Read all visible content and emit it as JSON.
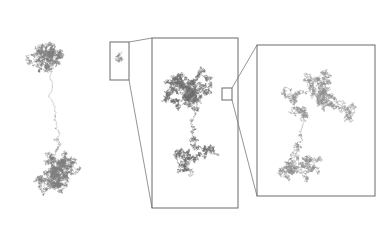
{
  "figure": {
    "background_color": "#ffffff",
    "width": 392,
    "height": 228,
    "walk_color": "#7d7d7d",
    "walk_color_dense": "#6e6e6e",
    "walk_color_sparse": "#8f8f8f",
    "frame_color": "#6b6b6b",
    "connector_color": "#7a7a7a",
    "frame_stroke_width": 1,
    "connector_stroke_width": 0.8
  },
  "panels": [
    {
      "id": "panel-1",
      "name": "full-view-walk",
      "has_frame": false,
      "frame": {
        "x": 14,
        "y": 16,
        "w": 118,
        "h": 200
      },
      "label": "",
      "magnification": "1x",
      "description": "Full random walk trace, two dense clusters joined by a thin filament",
      "zoom_box": {
        "x": 110,
        "y": 42,
        "w": 19,
        "h": 38
      }
    },
    {
      "id": "panel-2",
      "name": "first-magnification",
      "has_frame": true,
      "frame": {
        "x": 152,
        "y": 38,
        "w": 86,
        "h": 170
      },
      "label": "",
      "magnification": "~5x",
      "description": "Magnified content of the panel-1 zoom box; two dense sub-clusters",
      "zoom_box": {
        "x": 222,
        "y": 88,
        "w": 10,
        "h": 12
      }
    },
    {
      "id": "panel-3",
      "name": "second-magnification",
      "has_frame": true,
      "frame": {
        "x": 257,
        "y": 45,
        "w": 118,
        "h": 151
      },
      "label": "",
      "magnification": "~25x",
      "description": "Magnified content of the panel-2 zoom box; resolved individual steps, sparser filaments",
      "zoom_box": null
    }
  ],
  "connectors": [
    {
      "name": "connector-panel1-to-panel2",
      "from_box": "panel-1.zoom_box",
      "to_frame": "panel-2.frame",
      "lines": [
        {
          "x1": 129,
          "y1": 42,
          "x2": 152,
          "y2": 38
        },
        {
          "x1": 129,
          "y1": 80,
          "x2": 152,
          "y2": 208
        }
      ]
    },
    {
      "name": "connector-panel2-to-panel3",
      "from_box": "panel-2.zoom_box",
      "to_frame": "panel-3.frame",
      "lines": [
        {
          "x1": 232,
          "y1": 88,
          "x2": 257,
          "y2": 45
        },
        {
          "x1": 232,
          "y1": 100,
          "x2": 257,
          "y2": 196
        }
      ]
    }
  ],
  "chart_data": {
    "type": "scatter",
    "subtitle": "",
    "xlabel": "",
    "ylabel": "",
    "grid": false,
    "legend": null,
    "annotations": [],
    "series": [
      {
        "name": "walk-panel-1",
        "panel": "panel-1",
        "step_count": 9000,
        "step_length": 1.0,
        "seed": 20240417,
        "color": "#7d7d7d",
        "linewidth": 0.35,
        "bbox": [
          14,
          16,
          132,
          216
        ],
        "clusters": [
          {
            "cx": 60,
            "cy": 58,
            "radius": 46,
            "weight": 0.58
          },
          {
            "cx": 60,
            "cy": 172,
            "radius": 28,
            "weight": 0.26
          }
        ]
      },
      {
        "name": "walk-panel-2",
        "panel": "panel-2",
        "step_count": 7000,
        "step_length": 1.0,
        "seed": 881203,
        "color": "#6e6e6e",
        "linewidth": 0.4,
        "bbox": [
          152,
          38,
          238,
          208
        ],
        "clusters": [
          {
            "cx": 190,
            "cy": 88,
            "radius": 36,
            "weight": 0.5
          },
          {
            "cx": 192,
            "cy": 160,
            "radius": 30,
            "weight": 0.34
          }
        ]
      },
      {
        "name": "walk-panel-3",
        "panel": "panel-3",
        "step_count": 4200,
        "step_length": 1.35,
        "seed": 57311,
        "color": "#8f8f8f",
        "linewidth": 0.42,
        "bbox": [
          257,
          45,
          375,
          196
        ],
        "clusters": [
          {
            "cx": 318,
            "cy": 104,
            "radius": 46,
            "weight": 0.72
          },
          {
            "cx": 300,
            "cy": 168,
            "radius": 22,
            "weight": 0.17
          }
        ]
      },
      {
        "name": "walk-inset-panel-1-box",
        "panel": "panel-1",
        "step_count": 260,
        "step_length": 0.8,
        "seed": 4410,
        "color": "#8a8a8a",
        "linewidth": 0.3,
        "bbox": [
          111,
          44,
          128,
          78
        ],
        "clusters": [
          {
            "cx": 120,
            "cy": 55,
            "radius": 6,
            "weight": 0.55
          },
          {
            "cx": 119,
            "cy": 69,
            "radius": 5,
            "weight": 0.45
          }
        ]
      }
    ],
    "axis_ranges": {
      "x": [
        0,
        392
      ],
      "y": [
        0,
        228
      ]
    }
  }
}
